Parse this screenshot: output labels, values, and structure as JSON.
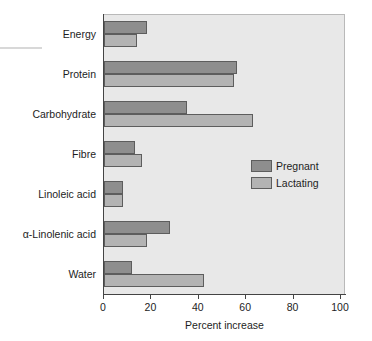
{
  "chart_data": {
    "type": "bar",
    "orientation": "horizontal",
    "title": "",
    "xlabel": "Percent increase",
    "ylabel": "",
    "xlim": [
      0,
      100
    ],
    "xticks": [
      0,
      20,
      40,
      60,
      80,
      100
    ],
    "xtick_labels": [
      "0",
      "20",
      "40",
      "60",
      "80",
      "100"
    ],
    "grid": false,
    "legend_position": "center-right",
    "categories": [
      "Energy",
      "Protein",
      "Carbohydrate",
      "Fibre",
      "Linoleic acid",
      "α-Linolenic acid",
      "Water"
    ],
    "series": [
      {
        "name": "Pregnant",
        "color": "#8e8e8e",
        "values": [
          18,
          56,
          35,
          13,
          8,
          28,
          12
        ]
      },
      {
        "name": "Lactating",
        "color": "#b3b3b3",
        "values": [
          14,
          55,
          63,
          16,
          8,
          18,
          42
        ]
      }
    ]
  },
  "legend": {
    "items": [
      {
        "label": "Pregnant"
      },
      {
        "label": "Lactating"
      }
    ]
  },
  "colors": {
    "pregnant": "#8e8e8e",
    "lactating": "#b3b3b3",
    "plot_background": "#e8e8e8",
    "axis": "#444444",
    "text": "#1d1d1d"
  }
}
